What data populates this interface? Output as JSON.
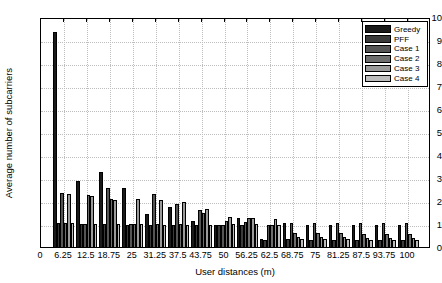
{
  "chart_data": {
    "type": "bar",
    "title": "",
    "xlabel": "User distances (m)",
    "ylabel": "Average number of subcarriers",
    "xlim": [
      0,
      106.25
    ],
    "ylim": [
      0,
      10
    ],
    "ytick_step": 1,
    "yticks": [
      0,
      1,
      2,
      3,
      4,
      5,
      6,
      7,
      8,
      9,
      10
    ],
    "grid": true,
    "legend_position": "top-right",
    "categories": [
      "6.25",
      "12.5",
      "18.75",
      "25",
      "31.25",
      "37.5",
      "43.75",
      "50",
      "56.25",
      "62.5",
      "68.75",
      "75",
      "81.25",
      "87.5",
      "93.75",
      "100"
    ],
    "xtick_labels": [
      "0",
      "6.25",
      "12.5",
      "18.75",
      "25",
      "31.25",
      "37.5",
      "43.75",
      "50",
      "56.25",
      "62.5",
      "68.75",
      "75",
      "81.25",
      "87.5",
      "93.75",
      "100"
    ],
    "series": [
      {
        "name": "Greedy",
        "color": "#1a1a1a",
        "values": [
          9.35,
          2.85,
          3.25,
          2.55,
          1.45,
          1.75,
          1.15,
          0.95,
          1.25,
          0.35,
          1.05,
          0.95,
          0.95,
          0.95,
          0.95,
          0.95
        ]
      },
      {
        "name": "PFF",
        "color": "#3a3a3a",
        "values": [
          1.05,
          1.0,
          1.0,
          0.95,
          0.95,
          0.95,
          0.95,
          0.95,
          0.95,
          0.3,
          0.35,
          0.3,
          0.3,
          0.3,
          0.3,
          0.3
        ]
      },
      {
        "name": "Case 1",
        "color": "#555555",
        "values": [
          2.35,
          1.0,
          2.55,
          1.0,
          2.3,
          1.85,
          1.6,
          0.95,
          1.1,
          0.95,
          1.05,
          1.05,
          1.05,
          1.05,
          1.05,
          1.05
        ]
      },
      {
        "name": "Case 2",
        "color": "#6e6e6e",
        "values": [
          1.05,
          2.25,
          2.1,
          1.0,
          1.0,
          1.0,
          1.5,
          1.15,
          1.25,
          0.95,
          0.6,
          0.6,
          0.6,
          0.55,
          0.55,
          0.55
        ]
      },
      {
        "name": "Case 3",
        "color": "#9a9a9a",
        "values": [
          2.3,
          2.2,
          2.05,
          2.1,
          2.05,
          1.95,
          1.65,
          1.3,
          1.25,
          1.2,
          0.45,
          0.45,
          0.45,
          0.4,
          0.4,
          0.4
        ]
      },
      {
        "name": "Case 4",
        "color": "#bdbdbd",
        "values": [
          1.05,
          1.0,
          1.0,
          1.0,
          0.95,
          0.95,
          0.95,
          1.0,
          1.0,
          0.95,
          0.35,
          0.35,
          0.35,
          0.3,
          0.3,
          0.3
        ]
      }
    ]
  },
  "legend": {
    "items": [
      {
        "label": "Greedy"
      },
      {
        "label": "PFF"
      },
      {
        "label": "Case 1"
      },
      {
        "label": "Case 2"
      },
      {
        "label": "Case 3"
      },
      {
        "label": "Case 4"
      }
    ]
  }
}
